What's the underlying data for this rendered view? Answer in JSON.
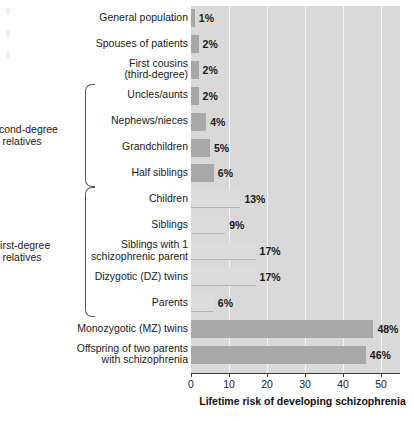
{
  "chart_data": {
    "type": "bar",
    "orientation": "horizontal",
    "title": "",
    "xlabel": "Lifetime risk of developing schizophrenia",
    "ylabel": "",
    "xlim": [
      0,
      55
    ],
    "xticks": [
      0,
      10,
      20,
      30,
      40,
      50
    ],
    "xtick_labels": [
      "0",
      "10",
      "20",
      "30",
      "40",
      "50"
    ],
    "grid": true,
    "grid_axis": "x",
    "legend": "none",
    "value_unit": "%",
    "categories": [
      "General population",
      "Spouses of patients",
      "First cousins\n(third-degree)",
      "Uncles/aunts",
      "Nephews/nieces",
      "Grandchildren",
      "Half siblings",
      "Children",
      "Siblings",
      "Siblings with 1\nschizophrenic parent",
      "Dizygotic (DZ) twins",
      "Parents",
      "Monozygotic (MZ) twins",
      "Offspring of two parents\nwith schizophrenia"
    ],
    "values": [
      1,
      2,
      2,
      2,
      4,
      5,
      6,
      13,
      9,
      17,
      17,
      6,
      48,
      46
    ],
    "value_labels": [
      "1%",
      "2%",
      "2%",
      "2%",
      "4%",
      "5%",
      "6%",
      "13%",
      "9%",
      "17%",
      "17%",
      "6%",
      "48%",
      "46%"
    ],
    "bar_styles": [
      "dark",
      "dark",
      "dark",
      "dark",
      "dark",
      "dark",
      "dark",
      "light",
      "light",
      "light",
      "light",
      "light",
      "dark",
      "dark"
    ],
    "groups": [
      {
        "label": "Second-degree\nrelatives",
        "first_index": 3,
        "last_index": 6
      },
      {
        "label": "First-degree\nrelatives",
        "first_index": 7,
        "last_index": 11
      }
    ],
    "colors": {
      "plot_background": "#d9d9d9",
      "gridline": "#f2f2f2",
      "bar_dark": "#a8a8a8",
      "bar_light": "#dcdcdc",
      "bar_light_edge": "#b4b4b4",
      "axis": "#3c3c3c",
      "text": "#1a1a1a",
      "bracket": "#55585c",
      "page_background": "#ffffff"
    }
  }
}
